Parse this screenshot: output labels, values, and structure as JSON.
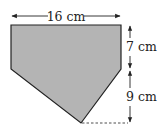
{
  "figure": {
    "type": "geometry-diagram",
    "colors": {
      "fill": "#b4b4b4",
      "stroke": "#222222",
      "annotation": "#222222",
      "background": "#ffffff"
    },
    "dimensions": {
      "width": {
        "value": 16,
        "unit": "cm",
        "label": "16 cm"
      },
      "rect_height": {
        "value": 7,
        "unit": "cm",
        "label": "7 cm"
      },
      "triangle_height": {
        "value": 9,
        "unit": "cm",
        "label": "9 cm"
      }
    },
    "labels": {
      "width_label": "16 cm",
      "rect_height_label": "7 cm",
      "triangle_height_label": "9 cm"
    }
  }
}
